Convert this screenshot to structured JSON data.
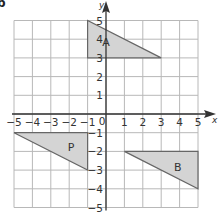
{
  "part_label": "b",
  "axes": {
    "x_label": "x",
    "y_label": "y",
    "x_ticks": [
      "-5",
      "-4",
      "-3",
      "-2",
      "-1",
      "0",
      "1",
      "2",
      "3",
      "4",
      "5"
    ],
    "y_ticks": [
      "5",
      "4",
      "3",
      "2",
      "1",
      "-1",
      "-2",
      "-3",
      "-4",
      "-5"
    ],
    "origin_label": "0",
    "range": {
      "xmin": -5,
      "xmax": 5,
      "ymin": -5,
      "ymax": 5
    }
  },
  "shapes": [
    {
      "label": "A",
      "vertices": [
        [
          -1,
          5
        ],
        [
          -1,
          3
        ],
        [
          3,
          3
        ]
      ],
      "label_pos": [
        0,
        3.8
      ]
    },
    {
      "label": "P",
      "vertices": [
        [
          -5,
          -1
        ],
        [
          -1,
          -1
        ],
        [
          -1,
          -3
        ]
      ],
      "label_pos": [
        -1.9,
        -1.8
      ]
    },
    {
      "label": "B",
      "vertices": [
        [
          1,
          -2
        ],
        [
          5,
          -2
        ],
        [
          5,
          -4
        ]
      ],
      "label_pos": [
        3.9,
        -2.9
      ]
    }
  ],
  "colors": {
    "grid": "#b8b8b8",
    "axis": "#333333",
    "shape_fill": "#d4d4d4",
    "shape_stroke": "#666666",
    "text": "#333333"
  }
}
